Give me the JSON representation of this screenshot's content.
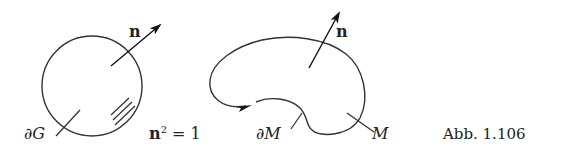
{
  "figure": {
    "left": {
      "boundary_label": "∂G",
      "normal_label": "n"
    },
    "equation": {
      "base": "n",
      "exponent": "2",
      "rest": " = 1"
    },
    "right": {
      "boundary_label": "∂M",
      "region_label": "M",
      "normal_label": "n"
    },
    "caption": "Abb. 1.106"
  }
}
